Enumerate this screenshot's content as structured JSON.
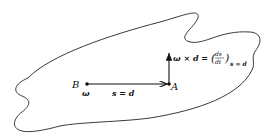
{
  "diagram": {
    "body_outline": "closed irregular rigid body",
    "points": {
      "B": {
        "label": "B",
        "sub_label": "ω"
      },
      "A": {
        "label": "A"
      }
    },
    "vectors": {
      "s": {
        "label": "s = d",
        "from": "B",
        "to": "A"
      },
      "velocity": {
        "label_main": "ω × d =",
        "frac_num": "ds",
        "frac_den": "dt",
        "subscript": "s = d"
      }
    },
    "colors": {
      "stroke": "#111111",
      "background": "#ffffff"
    }
  }
}
